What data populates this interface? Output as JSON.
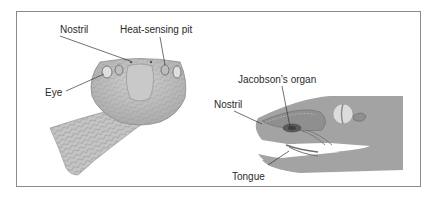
{
  "figure": {
    "left_panel": {
      "subject": "snake head, front view",
      "labels": {
        "nostril": "Nostril",
        "heat_pit": "Heat-sensing pit",
        "eye": "Eye"
      }
    },
    "right_panel": {
      "subject": "snake head, side cross-section",
      "labels": {
        "jacobsons_organ": "Jacobson’s organ",
        "nostril": "Nostril",
        "tongue": "Tongue"
      }
    },
    "colors": {
      "border": "#8a8a8a",
      "label_text": "#2a2a2a",
      "leader_line": "#333333",
      "head_fill": "#b5b5b5",
      "scale_line": "#8c8c8c",
      "section_fill": "#a3a3a3",
      "eye_fill": "#dcdcdc"
    }
  }
}
